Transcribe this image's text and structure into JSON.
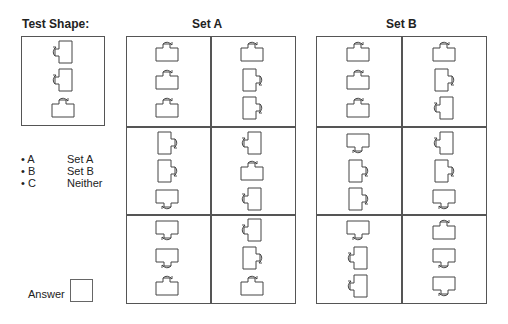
{
  "test": {
    "title": "Test Shape:",
    "shapes": [
      "left",
      "left",
      "up"
    ]
  },
  "set_a": {
    "title": "Set A",
    "cells": [
      [
        "up",
        "up",
        "up"
      ],
      [
        "up",
        "right",
        "right"
      ],
      [
        "right",
        "right",
        "down"
      ],
      [
        "left",
        "up",
        "left"
      ],
      [
        "down",
        "down",
        "up"
      ],
      [
        "left",
        "right",
        "up"
      ]
    ]
  },
  "set_b": {
    "title": "Set B",
    "cells": [
      [
        "up",
        "up",
        "up"
      ],
      [
        "up",
        "right",
        "left"
      ],
      [
        "down",
        "right",
        "right"
      ],
      [
        "left",
        "right",
        "down"
      ],
      [
        "down",
        "left",
        "left"
      ],
      [
        "up",
        "down",
        "down"
      ]
    ]
  },
  "options": [
    {
      "key": "• A",
      "label": "Set A"
    },
    {
      "key": "• B",
      "label": "Set B"
    },
    {
      "key": "• C",
      "label": "Neither"
    }
  ],
  "answer": {
    "label": "Answer",
    "value": ""
  },
  "colors": {
    "line": "#555555",
    "shape": "#444444"
  }
}
